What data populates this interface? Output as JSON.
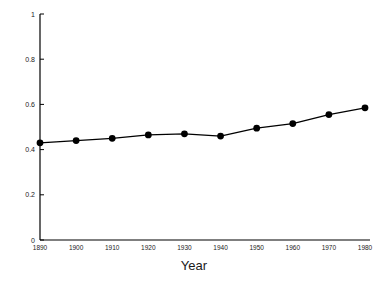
{
  "chart_data": {
    "type": "line",
    "title": "",
    "subtitle": "",
    "xlabel": "Year",
    "ylabel": "",
    "x": [
      1890,
      1900,
      1910,
      1920,
      1930,
      1940,
      1950,
      1960,
      1970,
      1980
    ],
    "categories": [
      "1890",
      "1900",
      "1910",
      "1920",
      "1930",
      "1940",
      "1950",
      "1960",
      "1970",
      "1980"
    ],
    "values": [
      0.43,
      0.44,
      0.45,
      0.465,
      0.47,
      0.46,
      0.495,
      0.515,
      0.555,
      0.585
    ],
    "series": [
      {
        "name": "series-1",
        "values": [
          0.43,
          0.44,
          0.45,
          0.465,
          0.47,
          0.46,
          0.495,
          0.515,
          0.555,
          0.585
        ]
      }
    ],
    "xlim": [
      1890,
      1980
    ],
    "ylim": [
      0,
      1
    ],
    "yticks": [
      0,
      0.2,
      0.4,
      0.6,
      0.8,
      1
    ],
    "ytick_labels": [
      "0",
      "0.2",
      "0.4",
      "0.6",
      "0.8",
      "1"
    ],
    "xticks": [
      1890,
      1900,
      1910,
      1920,
      1930,
      1940,
      1950,
      1960,
      1970,
      1980
    ],
    "xtick_labels": [
      "1890",
      "1900",
      "1910",
      "1920",
      "1930",
      "1940",
      "1950",
      "1960",
      "1970",
      "1980"
    ],
    "grid": false,
    "legend": false,
    "legend_position": "none",
    "line_color": "#000000",
    "marker_color": "#000000",
    "marker": "circle",
    "background_color": "#ffffff",
    "axis_color": "#000000"
  },
  "axis_titles": {
    "x": "Year"
  }
}
